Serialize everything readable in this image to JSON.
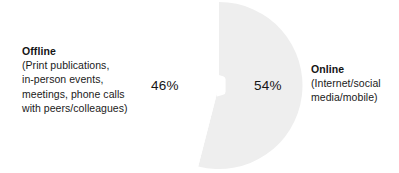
{
  "chart_data": {
    "type": "pie",
    "title": "",
    "subtitle": "",
    "xlabel": "",
    "ylabel": "",
    "legend_position": "outside-left-right",
    "grid": false,
    "categories": [
      "Offline",
      "Online"
    ],
    "values": [
      46,
      54
    ],
    "unit": "%",
    "slices": [
      {
        "label": "Offline",
        "description_lines": [
          "(Print publications,",
          "in-person events,",
          "meetings, phone calls",
          "with peers/colleagues)"
        ],
        "value": 46,
        "value_label": "46%",
        "color": "#ffffff",
        "side": "left"
      },
      {
        "label": "Online",
        "description_lines": [
          "(Internet/social",
          "media/mobile)"
        ],
        "value": 54,
        "value_label": "54%",
        "color": "#eeeeee",
        "side": "right"
      }
    ],
    "annotations": [],
    "colors": {
      "background": "#ffffff",
      "text": "#1a1a1a",
      "online_slice": "#eeeeee",
      "offline_slice": "#ffffff"
    }
  },
  "left_label": {
    "title": "Offline",
    "line1": "(Print publications,",
    "line2": "in-person events,",
    "line3": "meetings, phone calls",
    "line4": "with peers/colleagues)"
  },
  "right_label": {
    "title": "Online",
    "line1": "(Internet/social",
    "line2": "media/mobile)"
  },
  "values": {
    "offline_pct": "46%",
    "online_pct": "54%"
  }
}
